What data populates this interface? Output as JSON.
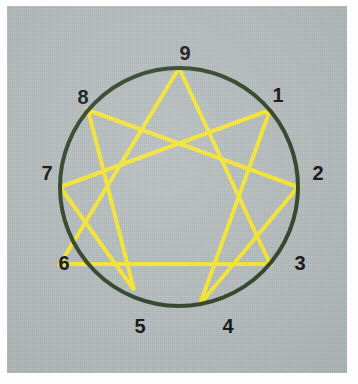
{
  "diagram": {
    "name": "Enneagram",
    "type": "enneagram-figure",
    "background_color": "#b4bcbd",
    "circle_color": "#36482f",
    "line_color": "#f2e236",
    "label_color": "#1c1c1c",
    "circle": {
      "cx": 172,
      "cy": 181,
      "r": 119,
      "stroke_width": 4
    },
    "points": [
      {
        "id": "1",
        "label": "1",
        "angle_deg": 40,
        "vertex_x": 263,
        "vertex_y": 104,
        "label_x": 271,
        "label_y": 89
      },
      {
        "id": "2",
        "label": "2",
        "angle_deg": 0,
        "vertex_x": 291,
        "vertex_y": 181,
        "label_x": 311,
        "label_y": 167
      },
      {
        "id": "3",
        "label": "3",
        "angle_deg": -40,
        "vertex_x": 263,
        "vertex_y": 258,
        "label_x": 293,
        "label_y": 257
      },
      {
        "id": "4",
        "label": "4",
        "angle_deg": -80,
        "vertex_x": 193,
        "vertex_y": 298,
        "label_x": 221,
        "label_y": 320
      },
      {
        "id": "5",
        "label": "5",
        "angle_deg": -120,
        "vertex_x": 127,
        "vertex_y": 284,
        "label_x": 133,
        "label_y": 320
      },
      {
        "id": "6",
        "label": "6",
        "angle_deg": 180,
        "vertex_x": 53,
        "vertex_y": 258,
        "label_x": 57,
        "label_y": 257
      },
      {
        "id": "7",
        "label": "7",
        "angle_deg": 160,
        "vertex_x": 53,
        "vertex_y": 181,
        "label_x": 40,
        "label_y": 167
      },
      {
        "id": "8",
        "label": "8",
        "angle_deg": 130,
        "vertex_x": 81,
        "vertex_y": 104,
        "label_x": 76,
        "label_y": 91
      },
      {
        "id": "9",
        "label": "9",
        "angle_deg": 90,
        "vertex_x": 172,
        "vertex_y": 62,
        "label_x": 178,
        "label_y": 47
      }
    ],
    "triangle_path": [
      "9",
      "3",
      "6",
      "9"
    ],
    "hexad_path": [
      "1",
      "4",
      "2",
      "8",
      "5",
      "7",
      "1"
    ],
    "line_width": 4
  }
}
